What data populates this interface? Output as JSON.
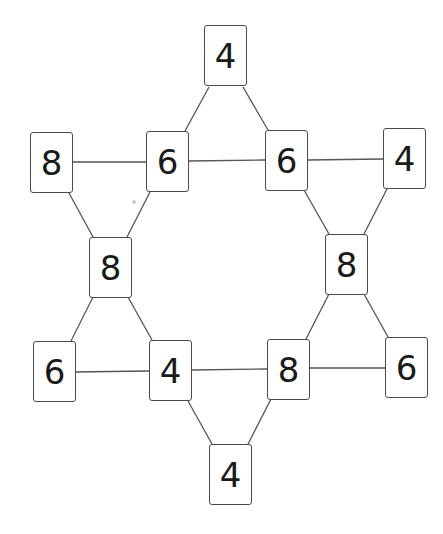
{
  "diagram": {
    "type": "number-card-hexagram-puzzle",
    "line_color": "#555555",
    "card_border_color": "#4a4a4a",
    "text_color": "#1a1a1a",
    "cards": [
      {
        "id": "top",
        "value": "4",
        "x": 204,
        "y": 25
      },
      {
        "id": "upper-far-left",
        "value": "8",
        "x": 30,
        "y": 132
      },
      {
        "id": "upper-left",
        "value": "6",
        "x": 146,
        "y": 131
      },
      {
        "id": "upper-right",
        "value": "6",
        "x": 265,
        "y": 130
      },
      {
        "id": "upper-far-right",
        "value": "4",
        "x": 383,
        "y": 128
      },
      {
        "id": "mid-left",
        "value": "8",
        "x": 89,
        "y": 237
      },
      {
        "id": "mid-right",
        "value": "8",
        "x": 325,
        "y": 234
      },
      {
        "id": "lower-far-left",
        "value": "6",
        "x": 33,
        "y": 341
      },
      {
        "id": "lower-left",
        "value": "4",
        "x": 149,
        "y": 340
      },
      {
        "id": "lower-right",
        "value": "8",
        "x": 267,
        "y": 339
      },
      {
        "id": "lower-far-right",
        "value": "6",
        "x": 385,
        "y": 337
      },
      {
        "id": "bottom",
        "value": "4",
        "x": 209,
        "y": 444
      }
    ],
    "edges": [
      [
        "top",
        "upper-left"
      ],
      [
        "top",
        "upper-right"
      ],
      [
        "upper-far-left",
        "upper-left"
      ],
      [
        "upper-left",
        "upper-right"
      ],
      [
        "upper-right",
        "upper-far-right"
      ],
      [
        "upper-far-left",
        "mid-left"
      ],
      [
        "upper-left",
        "mid-left"
      ],
      [
        "upper-right",
        "mid-right"
      ],
      [
        "upper-far-right",
        "mid-right"
      ],
      [
        "mid-left",
        "lower-far-left"
      ],
      [
        "mid-left",
        "lower-left"
      ],
      [
        "mid-right",
        "lower-right"
      ],
      [
        "mid-right",
        "lower-far-right"
      ],
      [
        "lower-far-left",
        "lower-left"
      ],
      [
        "lower-left",
        "lower-right"
      ],
      [
        "lower-right",
        "lower-far-right"
      ],
      [
        "lower-left",
        "bottom"
      ],
      [
        "lower-right",
        "bottom"
      ]
    ]
  }
}
